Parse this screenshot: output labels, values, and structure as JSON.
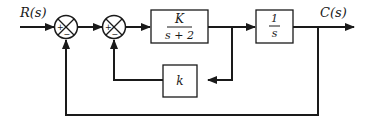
{
  "diagram": {
    "type": "control-system block diagram",
    "input_label": "R(s)",
    "output_label": "C(s)",
    "summing_junctions": [
      {
        "id": "sum1",
        "signs": {
          "left": "+",
          "bottom": "−"
        }
      },
      {
        "id": "sum2",
        "signs": {
          "left": "+",
          "bottom": "−"
        }
      }
    ],
    "blocks": [
      {
        "id": "plant",
        "numerator": "K",
        "denominator": "s + 2"
      },
      {
        "id": "integrator",
        "numerator": "1",
        "denominator": "s"
      },
      {
        "id": "inner-feedback",
        "label": "k"
      }
    ],
    "connections": [
      "R(s) → sum1 (+)",
      "sum1 → sum2 (+)",
      "sum2 → K/(s+2)",
      "K/(s+2) → 1/s",
      "1/s → C(s)",
      "K/(s+2) output → k → sum2 (−)",
      "C(s) → sum1 (−)"
    ]
  }
}
